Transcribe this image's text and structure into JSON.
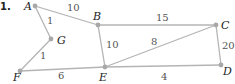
{
  "problem_number": "1.",
  "colors": {
    "edge": "#b4b4b4",
    "node": "#a8a8a8",
    "label": "#222222",
    "weight": "#555555"
  },
  "nodes": [
    {
      "id": "A",
      "label": "A",
      "x": 35,
      "y": 6,
      "lx": 24,
      "ly": 10
    },
    {
      "id": "B",
      "label": "B",
      "x": 98,
      "y": 25,
      "lx": 93,
      "ly": 20
    },
    {
      "id": "C",
      "label": "C",
      "x": 216,
      "y": 25,
      "lx": 221,
      "ly": 29
    },
    {
      "id": "D",
      "label": "D",
      "x": 221,
      "y": 65,
      "lx": 223,
      "ly": 75
    },
    {
      "id": "E",
      "label": "E",
      "x": 105,
      "y": 67,
      "lx": 99,
      "ly": 81
    },
    {
      "id": "F",
      "label": "F",
      "x": 20,
      "y": 71,
      "lx": 13,
      "ly": 81
    },
    {
      "id": "G",
      "label": "G",
      "x": 51,
      "y": 39,
      "lx": 57,
      "ly": 44
    }
  ],
  "edges": [
    {
      "from": "A",
      "to": "B",
      "weight": "10",
      "wx": 67,
      "wy": 11
    },
    {
      "from": "A",
      "to": "G",
      "weight": "1",
      "wx": 47,
      "wy": 24
    },
    {
      "from": "G",
      "to": "F",
      "weight": "1",
      "wx": 40,
      "wy": 59
    },
    {
      "from": "F",
      "to": "E",
      "weight": "6",
      "wx": 58,
      "wy": 79
    },
    {
      "from": "B",
      "to": "E",
      "weight": "10",
      "wx": 106,
      "wy": 48
    },
    {
      "from": "B",
      "to": "C",
      "weight": "15",
      "wx": 156,
      "wy": 21
    },
    {
      "from": "E",
      "to": "C",
      "weight": "8",
      "wx": 151,
      "wy": 45
    },
    {
      "from": "C",
      "to": "D",
      "weight": "20",
      "wx": 222,
      "wy": 49
    },
    {
      "from": "E",
      "to": "D",
      "weight": "4",
      "wx": 161,
      "wy": 80
    }
  ]
}
